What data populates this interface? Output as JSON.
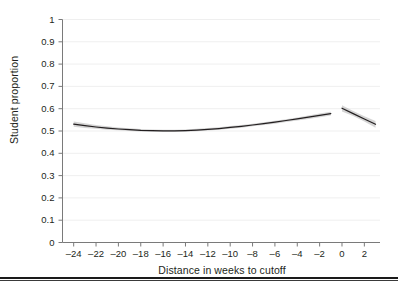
{
  "chart_data": {
    "type": "line",
    "title": "",
    "xlabel": "Distance in weeks to cutoff",
    "ylabel": "Student proportion",
    "xlim": [
      -25,
      3.4
    ],
    "ylim": [
      0,
      1
    ],
    "grid": true,
    "grid_axis": "y",
    "legend": "none",
    "xticks": [
      -24,
      -22,
      -20,
      -18,
      -16,
      -14,
      -12,
      -10,
      -8,
      -6,
      -4,
      -2,
      0,
      2
    ],
    "xtick_labels": [
      "–24",
      "–22",
      "–20",
      "–18",
      "–16",
      "–14",
      "–12",
      "–10",
      "–8",
      "–6",
      "–4",
      "–2",
      "0",
      "2"
    ],
    "yticks": [
      0,
      0.1,
      0.2,
      0.3,
      0.4,
      0.5,
      0.6,
      0.7,
      0.8,
      0.9,
      1
    ],
    "ytick_labels": [
      "0",
      "0.1",
      "0.2",
      "0.3",
      "0.4",
      "0.5",
      "0.6",
      "0.7",
      "0.8",
      "0.9",
      "1"
    ],
    "cutoff": 0,
    "series": [
      {
        "name": "Fitted proportion (left of cutoff)",
        "color": "#231f20",
        "band_color": "#b3b3b3",
        "x": [
          -24,
          -23,
          -22,
          -21,
          -20,
          -19,
          -18,
          -17,
          -16,
          -15,
          -14,
          -13,
          -12,
          -11,
          -10,
          -9,
          -8,
          -7,
          -6,
          -5,
          -4,
          -3,
          -2,
          -1
        ],
        "y": [
          0.531,
          0.524,
          0.518,
          0.513,
          0.509,
          0.506,
          0.503,
          0.502,
          0.501,
          0.501,
          0.502,
          0.504,
          0.507,
          0.511,
          0.516,
          0.521,
          0.527,
          0.533,
          0.54,
          0.547,
          0.554,
          0.562,
          0.57,
          0.578
        ],
        "y_lower": [
          0.519,
          0.514,
          0.51,
          0.506,
          0.503,
          0.5,
          0.498,
          0.497,
          0.496,
          0.496,
          0.497,
          0.499,
          0.502,
          0.506,
          0.51,
          0.515,
          0.521,
          0.527,
          0.533,
          0.54,
          0.547,
          0.554,
          0.562,
          0.57
        ],
        "y_upper": [
          0.543,
          0.535,
          0.527,
          0.521,
          0.516,
          0.512,
          0.509,
          0.507,
          0.506,
          0.506,
          0.507,
          0.51,
          0.513,
          0.517,
          0.522,
          0.527,
          0.533,
          0.539,
          0.546,
          0.553,
          0.561,
          0.569,
          0.578,
          0.586
        ]
      },
      {
        "name": "Fitted proportion (right of cutoff)",
        "color": "#231f20",
        "band_color": "#b3b3b3",
        "x": [
          0,
          1,
          2,
          3
        ],
        "y": [
          0.602,
          0.578,
          0.554,
          0.53
        ],
        "y_lower": [
          0.588,
          0.567,
          0.543,
          0.515
        ],
        "y_upper": [
          0.616,
          0.59,
          0.566,
          0.545
        ]
      }
    ]
  },
  "axes": {
    "ylabel_text": "Student proportion",
    "xlabel_text": "Distance in weeks to cutoff"
  }
}
